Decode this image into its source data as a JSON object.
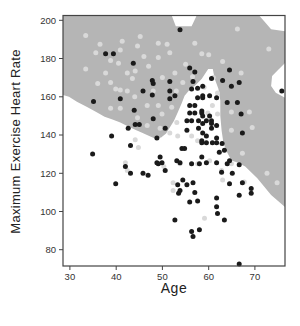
{
  "figure": {
    "x_axis_label": "Age",
    "y_axis_label": "Maximum Exercise Heart Rate"
  },
  "colors": {
    "background": "#ffffff",
    "decision_region": "#b5b5b5",
    "point_light": "#d9d9d9",
    "point_dark": "#1a1a1a",
    "axis_line": "#444444",
    "tick_text": "#333333"
  },
  "chart_data": {
    "type": "scatter",
    "title": "",
    "xlabel": "Age",
    "ylabel": "Maximum Exercise Heart Rate",
    "xlim": [
      28.5,
      76.5
    ],
    "ylim": [
      71.5,
      202.5
    ],
    "x_ticks": [
      30,
      40,
      50,
      60,
      70
    ],
    "y_ticks": [
      80,
      100,
      120,
      140,
      160,
      180,
      200
    ],
    "grid": false,
    "legend": "none",
    "region": {
      "name": "shaded-classifier-region",
      "color": "#b5b5b5",
      "polygon": [
        [
          28.5,
          202.5
        ],
        [
          52.0,
          202.5
        ],
        [
          52.9,
          196.9
        ],
        [
          56.3,
          196.9
        ],
        [
          57.4,
          202.5
        ],
        [
          70.9,
          202.5
        ],
        [
          72.0,
          199.5
        ],
        [
          73.5,
          195.3
        ],
        [
          76.5,
          194.3
        ],
        [
          76.5,
          177.7
        ],
        [
          75.2,
          174.5
        ],
        [
          73.7,
          170.9
        ],
        [
          73.5,
          165.7
        ],
        [
          74.5,
          162.1
        ],
        [
          76.5,
          159.5
        ],
        [
          76.5,
          102.3
        ],
        [
          73.5,
          108.6
        ],
        [
          70.5,
          117.4
        ],
        [
          67.9,
          123.6
        ],
        [
          66.2,
          125.7
        ],
        [
          64.9,
          126.7
        ],
        [
          64.0,
          130.9
        ],
        [
          63.2,
          135.6
        ],
        [
          62.8,
          142.3
        ],
        [
          62.5,
          150.1
        ],
        [
          62.5,
          157.9
        ],
        [
          62.1,
          164.2
        ],
        [
          61.3,
          169.4
        ],
        [
          60.9,
          174.5
        ],
        [
          59.9,
          174.5
        ],
        [
          58.5,
          169.4
        ],
        [
          57.2,
          166.2
        ],
        [
          55.7,
          163.1
        ],
        [
          54.8,
          160.5
        ],
        [
          54.2,
          156.9
        ],
        [
          53.3,
          151.7
        ],
        [
          52.5,
          147.5
        ],
        [
          51.6,
          143.9
        ],
        [
          50.8,
          140.8
        ],
        [
          49.7,
          138.7
        ],
        [
          48.4,
          138.2
        ],
        [
          46.9,
          139.7
        ],
        [
          45.6,
          141.2
        ],
        [
          44.1,
          142.8
        ],
        [
          42.6,
          144.4
        ],
        [
          40.9,
          146.5
        ],
        [
          39.2,
          148.1
        ],
        [
          37.5,
          149.6
        ],
        [
          35.6,
          152.2
        ],
        [
          33.6,
          154.8
        ],
        [
          31.5,
          157.4
        ],
        [
          29.8,
          160.0
        ],
        [
          28.5,
          161.0
        ]
      ]
    },
    "series": [
      {
        "name": "light-points",
        "color": "#d9d9d9",
        "points": [
          [
            33.4,
            192
          ],
          [
            35.6,
            183
          ],
          [
            36.5,
            187.5
          ],
          [
            38.8,
            179
          ],
          [
            40.9,
            184.5
          ],
          [
            41.3,
            189
          ],
          [
            40.5,
            177.5
          ],
          [
            42.4,
            172.5
          ],
          [
            37.7,
            172.5
          ],
          [
            33.4,
            174.5
          ],
          [
            44.6,
            186.5
          ],
          [
            45.2,
            191.5
          ],
          [
            44.1,
            173.5
          ],
          [
            43.5,
            169.5
          ],
          [
            38.8,
            167.5
          ],
          [
            36.0,
            167
          ],
          [
            49.1,
            188
          ],
          [
            51.0,
            187.5
          ],
          [
            51.6,
            183
          ],
          [
            58.5,
            182.5
          ],
          [
            49.1,
            180.5
          ],
          [
            52.7,
            172.5
          ],
          [
            54.4,
            167.5
          ],
          [
            47.0,
            176
          ],
          [
            50.0,
            170
          ],
          [
            46.0,
            181
          ],
          [
            55.0,
            177
          ],
          [
            57.0,
            188
          ],
          [
            60.0,
            182
          ],
          [
            61.0,
            170
          ],
          [
            48.0,
            163
          ],
          [
            53.0,
            163
          ],
          [
            56.5,
            170.5
          ],
          [
            59.0,
            165
          ],
          [
            44.0,
            160
          ],
          [
            40.9,
            163.5
          ],
          [
            39.9,
            164
          ],
          [
            42.4,
            163
          ],
          [
            46.7,
            155.5
          ],
          [
            49.1,
            155.5
          ],
          [
            52.0,
            154.5
          ],
          [
            46.7,
            145
          ],
          [
            49.9,
            151
          ],
          [
            53.1,
            146.5
          ],
          [
            60.8,
            155.5
          ],
          [
            61.9,
            151
          ],
          [
            59.8,
            151.5
          ],
          [
            64.9,
            152
          ],
          [
            68.8,
            152
          ],
          [
            69.4,
            144
          ],
          [
            64.9,
            142.5
          ],
          [
            61.9,
            162
          ],
          [
            44.6,
            149
          ],
          [
            38.8,
            154
          ],
          [
            40.9,
            154
          ],
          [
            44.1,
            137.5
          ],
          [
            44.8,
            133.5
          ],
          [
            42.0,
            125.5
          ],
          [
            49.5,
            143.5
          ],
          [
            51.6,
            141
          ],
          [
            53.3,
            139.5
          ],
          [
            42.4,
            121.5
          ],
          [
            50.3,
            123.5
          ],
          [
            52.3,
            115
          ],
          [
            52.3,
            111
          ],
          [
            57.6,
            125
          ],
          [
            53.8,
            125
          ],
          [
            59.1,
            96.5
          ],
          [
            63.0,
            116.5
          ],
          [
            67.7,
            115.5
          ],
          [
            72.6,
            120
          ],
          [
            74.8,
            115
          ],
          [
            67.3,
            130.5
          ],
          [
            60.2,
            126.5
          ],
          [
            62.8,
            121.5
          ],
          [
            64.9,
            125
          ],
          [
            56.3,
            139.5
          ],
          [
            57.6,
            137
          ],
          [
            66.2,
            195.5
          ],
          [
            63.0,
            178.5
          ],
          [
            67.0,
            172.5
          ],
          [
            73.0,
            185
          ]
        ]
      },
      {
        "name": "dark-points",
        "color": "#1a1a1a",
        "points": [
          [
            37.7,
            182.5
          ],
          [
            39.4,
            182.5
          ],
          [
            43.7,
            177.5
          ],
          [
            53.8,
            195
          ],
          [
            55.9,
            175
          ],
          [
            57.0,
            173
          ],
          [
            47.8,
            168.5
          ],
          [
            48.0,
            167
          ],
          [
            51.6,
            168
          ],
          [
            60.6,
            169.5
          ],
          [
            56.6,
            168
          ],
          [
            64.5,
            174
          ],
          [
            63.0,
            168.5
          ],
          [
            64.9,
            165.5
          ],
          [
            66.6,
            167.5
          ],
          [
            35.1,
            157.5
          ],
          [
            40.9,
            159
          ],
          [
            43.9,
            153
          ],
          [
            42.6,
            143.5
          ],
          [
            39.0,
            139.5
          ],
          [
            34.9,
            130
          ],
          [
            43.1,
            134.5
          ],
          [
            44.1,
            145.5
          ],
          [
            45.0,
            145.5
          ],
          [
            45.8,
            163
          ],
          [
            47.8,
            161
          ],
          [
            51.6,
            163
          ],
          [
            51.6,
            159
          ],
          [
            52.7,
            160.5
          ],
          [
            48.0,
            148.5
          ],
          [
            50.6,
            143.5
          ],
          [
            48.8,
            138.5
          ],
          [
            56.3,
            164
          ],
          [
            57.6,
            164.5
          ],
          [
            57.6,
            159.5
          ],
          [
            58.7,
            159.5
          ],
          [
            60.2,
            160.5
          ],
          [
            61.7,
            159.5
          ],
          [
            55.9,
            155.5
          ],
          [
            57.0,
            155.5
          ],
          [
            55.9,
            151.5
          ],
          [
            57.0,
            151.5
          ],
          [
            58.5,
            152.5
          ],
          [
            55.3,
            147.5
          ],
          [
            56.3,
            147.5
          ],
          [
            57.8,
            147.5
          ],
          [
            59.5,
            147.5
          ],
          [
            60.6,
            147.5
          ],
          [
            61.7,
            145
          ],
          [
            60.6,
            143.5
          ],
          [
            57.8,
            143.5
          ],
          [
            55.3,
            142.5
          ],
          [
            54.2,
            133
          ],
          [
            54.8,
            133
          ],
          [
            58.5,
            137
          ],
          [
            59.5,
            139.5
          ],
          [
            61.7,
            138.5
          ],
          [
            61.7,
            136
          ],
          [
            49.5,
            128.5
          ],
          [
            48.8,
            125.5
          ],
          [
            49.9,
            125.5
          ],
          [
            53.1,
            126.5
          ],
          [
            58.5,
            128.5
          ],
          [
            62.3,
            131
          ],
          [
            61.7,
            125.5
          ],
          [
            58.7,
            165.5
          ],
          [
            58.7,
            160.5
          ],
          [
            58.5,
            151.5
          ],
          [
            58.7,
            150
          ],
          [
            60.2,
            150
          ],
          [
            58.7,
            146
          ],
          [
            60.6,
            146
          ],
          [
            58.7,
            141
          ],
          [
            58.5,
            136
          ],
          [
            59.5,
            136
          ],
          [
            60.8,
            136
          ],
          [
            62.9,
            135.5
          ],
          [
            63.4,
            132
          ],
          [
            64.5,
            126.5
          ],
          [
            67.0,
            151
          ],
          [
            67.3,
            141
          ],
          [
            64.0,
            157
          ],
          [
            66.2,
            157
          ],
          [
            75.8,
            163
          ],
          [
            64.0,
            125
          ],
          [
            66.6,
            124.5
          ],
          [
            65.1,
            120
          ],
          [
            62.8,
            120.5
          ],
          [
            67.3,
            115
          ],
          [
            64.5,
            114.5
          ],
          [
            69.2,
            112
          ],
          [
            69.2,
            109.5
          ],
          [
            66.6,
            108.5
          ],
          [
            61.7,
            107
          ],
          [
            61.7,
            102.5
          ],
          [
            61.9,
            99
          ],
          [
            63.4,
            95.5
          ],
          [
            49.1,
            125
          ],
          [
            53.8,
            125.5
          ],
          [
            56.3,
            125
          ],
          [
            58.0,
            125
          ],
          [
            59.5,
            125.5
          ],
          [
            50.6,
            121.5
          ],
          [
            45.8,
            120
          ],
          [
            46.9,
            119
          ],
          [
            54.4,
            116.5
          ],
          [
            53.3,
            114
          ],
          [
            55.3,
            114
          ],
          [
            56.6,
            115
          ],
          [
            53.8,
            111
          ],
          [
            53.5,
            109.5
          ],
          [
            57.0,
            110
          ],
          [
            55.9,
            105
          ],
          [
            57.6,
            105.5
          ],
          [
            52.7,
            95.5
          ],
          [
            56.3,
            89.5
          ],
          [
            58.0,
            90.5
          ],
          [
            56.6,
            87
          ],
          [
            42.0,
            123.5
          ],
          [
            43.1,
            120
          ],
          [
            39.9,
            114.5
          ],
          [
            66.6,
            72.5
          ]
        ]
      }
    ]
  }
}
